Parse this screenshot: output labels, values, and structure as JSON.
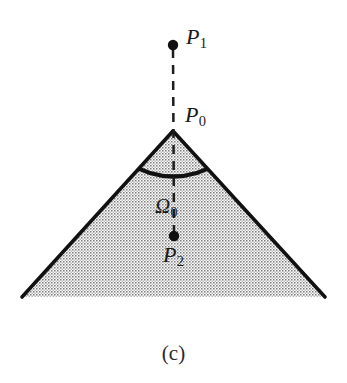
{
  "figure": {
    "caption": "(c)",
    "background_color": "#ffffff",
    "ink_color": "#111111",
    "fill_pattern": "stipple-dots",
    "fill_tone": "#9a9a9a",
    "labels": {
      "p1": {
        "base": "P",
        "sub": "1"
      },
      "p0": {
        "base": "P",
        "sub": "0"
      },
      "omega0": {
        "base": "Ω",
        "sub": "0"
      },
      "p2": {
        "base": "P",
        "sub": "2"
      }
    },
    "points": [
      {
        "name": "P1",
        "x": 173,
        "y": 45,
        "marker": "filled-dot",
        "radius": 5
      },
      {
        "name": "P0",
        "x": 173,
        "y": 131,
        "marker": "apex-vertex"
      },
      {
        "name": "P2",
        "x": 174,
        "y": 236,
        "marker": "filled-dot",
        "radius": 5
      }
    ],
    "shapes": {
      "wedge": {
        "type": "triangle",
        "apex": {
          "x": 173,
          "y": 131
        },
        "base_left": {
          "x": 22,
          "y": 297
        },
        "base_right": {
          "x": 325,
          "y": 297
        },
        "stroke_width": 3.5,
        "base_stroke": "none"
      },
      "arc": {
        "type": "concave-arc",
        "left_end": {
          "x": 128,
          "y": 164
        },
        "right_end": {
          "x": 219,
          "y": 164
        },
        "sag": {
          "x": 173,
          "y": 180
        },
        "stroke_width": 4
      },
      "dashed_axis": {
        "type": "dashed-line",
        "from": {
          "x": 173,
          "y": 48
        },
        "to": {
          "x": 174,
          "y": 233
        },
        "dash": "9 7",
        "stroke_width": 2.4
      }
    }
  }
}
